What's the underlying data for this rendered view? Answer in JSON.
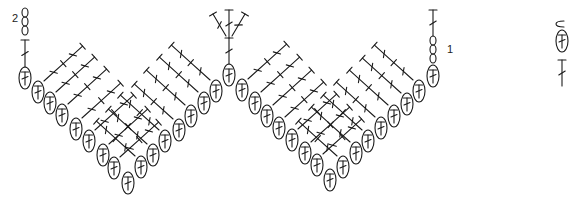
{
  "diagram": {
    "type": "crochet-chart",
    "pattern": "chevron / ripple",
    "stroke_color": "#1a1a1a",
    "background": "#ffffff",
    "row_labels": [
      {
        "text": "2",
        "x": 12,
        "y": 12
      },
      {
        "text": "1",
        "x": 447,
        "y": 43
      }
    ],
    "row1_ovals": [
      [
        25,
        78
      ],
      [
        38,
        92
      ],
      [
        50,
        103
      ],
      [
        62,
        115
      ],
      [
        76,
        129
      ],
      [
        89,
        141
      ],
      [
        103,
        155
      ],
      [
        114,
        168
      ],
      [
        128,
        183
      ],
      [
        141,
        167
      ],
      [
        153,
        155
      ],
      [
        165,
        141
      ],
      [
        179,
        130
      ],
      [
        191,
        116
      ],
      [
        204,
        103
      ],
      [
        216,
        91
      ],
      [
        229,
        75
      ],
      [
        242,
        90
      ],
      [
        255,
        103
      ],
      [
        267,
        116
      ],
      [
        279,
        128
      ],
      [
        292,
        140
      ],
      [
        305,
        153
      ],
      [
        317,
        165
      ],
      [
        330,
        180
      ],
      [
        343,
        167
      ],
      [
        356,
        153
      ],
      [
        368,
        141
      ],
      [
        381,
        128
      ],
      [
        394,
        116
      ],
      [
        407,
        104
      ],
      [
        419,
        91
      ],
      [
        433,
        76
      ]
    ],
    "valley_indices": [
      8,
      24
    ],
    "peak_indices": [
      0,
      16,
      32
    ],
    "start_chain": {
      "x": 25,
      "y_top": 8,
      "count": 3,
      "label": "2"
    },
    "end_chain": {
      "x": 433,
      "y_top": 36,
      "count": 3,
      "label": "1"
    },
    "legend": [
      {
        "symbol": "chain-stitch-icon",
        "x": 556,
        "y": 24
      },
      {
        "symbol": "dc-in-loop-icon",
        "x": 556,
        "y": 41
      },
      {
        "symbol": "double-crochet-icon",
        "x": 556,
        "y": 66
      }
    ]
  }
}
